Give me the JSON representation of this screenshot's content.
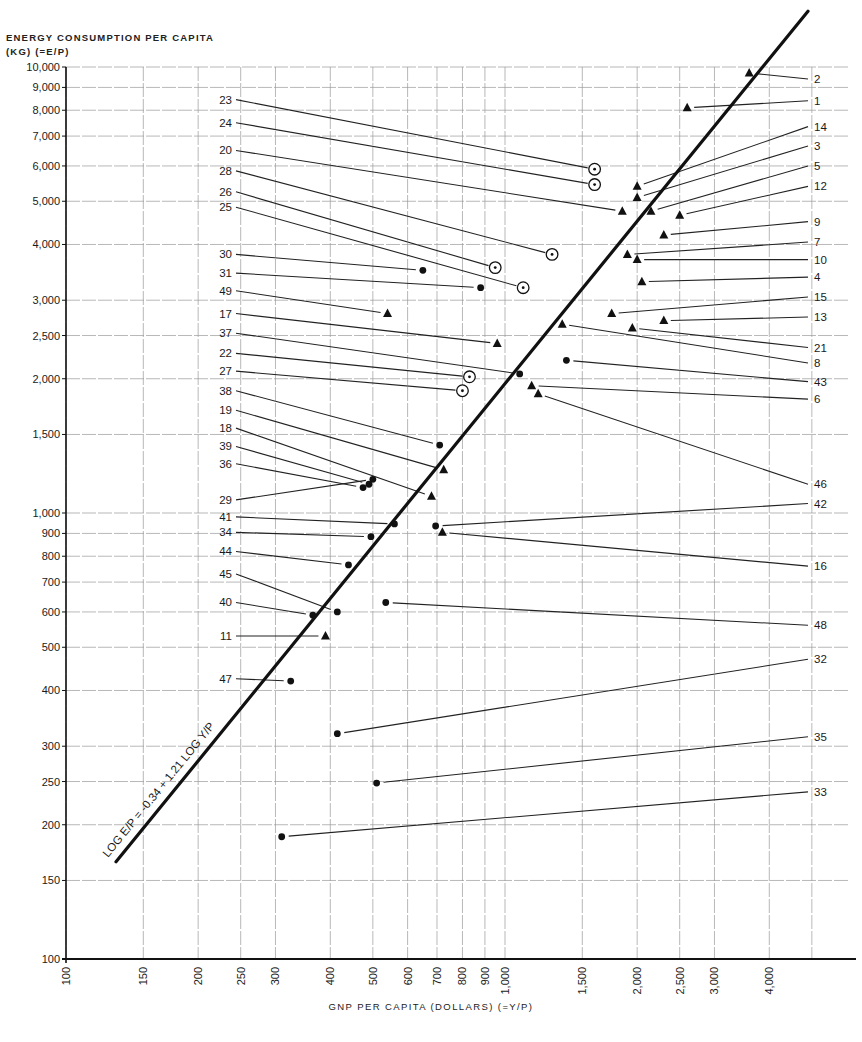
{
  "chart_data": {
    "type": "scatter",
    "title": "",
    "ylabel_line1": "ENERGY CONSUMPTION PER CAPITA",
    "ylabel_line2": "(KG) (=E/P)",
    "xlabel": "GNP PER CAPITA (DOLLARS) (=Y/P)",
    "x_scale": "log",
    "y_scale": "log",
    "xlim": [
      100,
      5200
    ],
    "ylim": [
      100,
      10000
    ],
    "grid": true,
    "x_ticks": [
      "100",
      "150",
      "200",
      "250",
      "300",
      "400",
      "500",
      "600",
      "700",
      "800",
      "900",
      "1,000",
      "1,500",
      "2,000",
      "2,500",
      "3,000",
      "4,000"
    ],
    "x_tick_values": [
      100,
      150,
      200,
      250,
      300,
      400,
      500,
      600,
      700,
      800,
      900,
      1000,
      1500,
      2000,
      2500,
      3000,
      4000
    ],
    "y_ticks": [
      "100",
      "150",
      "200",
      "250",
      "300",
      "400",
      "500",
      "600",
      "700",
      "800",
      "900",
      "1,000",
      "1,500",
      "2,000",
      "2,500",
      "3,000",
      "4,000",
      "5,000",
      "6,000",
      "7,000",
      "8,000",
      "9,000",
      "10,000"
    ],
    "y_tick_values": [
      100,
      150,
      200,
      250,
      300,
      400,
      500,
      600,
      700,
      800,
      900,
      1000,
      1500,
      2000,
      2500,
      3000,
      4000,
      5000,
      6000,
      7000,
      8000,
      9000,
      10000
    ],
    "regression": {
      "label": "LOG E/P = -0.34 + 1.21 LOG Y/P",
      "intercept": -0.34,
      "slope": 1.21,
      "x_range": [
        130,
        4900
      ]
    },
    "marker_legend": {
      "triangle": "filled triangle",
      "dot": "filled circle",
      "circled_dot": "circle with center dot"
    },
    "points": [
      {
        "id": "1",
        "marker": "triangle",
        "x": 2600,
        "y": 8100,
        "label_side": "right"
      },
      {
        "id": "2",
        "marker": "triangle",
        "x": 3600,
        "y": 9700,
        "label_side": "right"
      },
      {
        "id": "3",
        "marker": "triangle",
        "x": 2000,
        "y": 5100,
        "label_side": "right"
      },
      {
        "id": "4",
        "marker": "triangle",
        "x": 2050,
        "y": 3300,
        "label_side": "right"
      },
      {
        "id": "5",
        "marker": "triangle",
        "x": 2150,
        "y": 4750,
        "label_side": "right"
      },
      {
        "id": "6",
        "marker": "triangle",
        "x": 1150,
        "y": 1930,
        "label_side": "right"
      },
      {
        "id": "7",
        "marker": "triangle",
        "x": 1900,
        "y": 3800,
        "label_side": "right"
      },
      {
        "id": "8",
        "marker": "triangle",
        "x": 1350,
        "y": 2650,
        "label_side": "right"
      },
      {
        "id": "9",
        "marker": "triangle",
        "x": 2300,
        "y": 4200,
        "label_side": "right"
      },
      {
        "id": "10",
        "marker": "triangle",
        "x": 2000,
        "y": 3700,
        "label_side": "right"
      },
      {
        "id": "11",
        "marker": "triangle",
        "x": 390,
        "y": 530,
        "label_side": "left"
      },
      {
        "id": "12",
        "marker": "triangle",
        "x": 2500,
        "y": 4650,
        "label_side": "right"
      },
      {
        "id": "13",
        "marker": "triangle",
        "x": 2300,
        "y": 2700,
        "label_side": "right"
      },
      {
        "id": "14",
        "marker": "triangle",
        "x": 2000,
        "y": 5400,
        "label_side": "right"
      },
      {
        "id": "15",
        "marker": "triangle",
        "x": 1750,
        "y": 2800,
        "label_side": "right"
      },
      {
        "id": "16",
        "marker": "triangle",
        "x": 720,
        "y": 905,
        "label_side": "right"
      },
      {
        "id": "17",
        "marker": "triangle",
        "x": 960,
        "y": 2400,
        "label_side": "left"
      },
      {
        "id": "18",
        "marker": "triangle",
        "x": 680,
        "y": 1090,
        "label_side": "left"
      },
      {
        "id": "19",
        "marker": "triangle",
        "x": 725,
        "y": 1250,
        "label_side": "left"
      },
      {
        "id": "20",
        "marker": "triangle",
        "x": 1850,
        "y": 4750,
        "label_side": "left"
      },
      {
        "id": "21",
        "marker": "triangle",
        "x": 1950,
        "y": 2600,
        "label_side": "right"
      },
      {
        "id": "22",
        "marker": "circled_dot",
        "x": 830,
        "y": 2020,
        "label_side": "left"
      },
      {
        "id": "23",
        "marker": "circled_dot",
        "x": 1600,
        "y": 5900,
        "label_side": "left"
      },
      {
        "id": "24",
        "marker": "circled_dot",
        "x": 1600,
        "y": 5450,
        "label_side": "left"
      },
      {
        "id": "25",
        "marker": "circled_dot",
        "x": 1100,
        "y": 3200,
        "label_side": "left"
      },
      {
        "id": "26",
        "marker": "circled_dot",
        "x": 950,
        "y": 3550,
        "label_side": "left"
      },
      {
        "id": "27",
        "marker": "circled_dot",
        "x": 800,
        "y": 1880,
        "label_side": "left"
      },
      {
        "id": "28",
        "marker": "circled_dot",
        "x": 1280,
        "y": 3800,
        "label_side": "left"
      },
      {
        "id": "29",
        "marker": "dot",
        "x": 500,
        "y": 1190,
        "label_side": "left"
      },
      {
        "id": "30",
        "marker": "dot",
        "x": 650,
        "y": 3500,
        "label_side": "left"
      },
      {
        "id": "31",
        "marker": "dot",
        "x": 880,
        "y": 3200,
        "label_side": "left"
      },
      {
        "id": "32",
        "marker": "dot",
        "x": 415,
        "y": 320,
        "label_side": "right"
      },
      {
        "id": "33",
        "marker": "dot",
        "x": 310,
        "y": 188,
        "label_side": "right"
      },
      {
        "id": "34",
        "marker": "dot",
        "x": 495,
        "y": 885,
        "label_side": "left"
      },
      {
        "id": "35",
        "marker": "dot",
        "x": 510,
        "y": 248,
        "label_side": "right"
      },
      {
        "id": "36",
        "marker": "dot",
        "x": 475,
        "y": 1140,
        "label_side": "left"
      },
      {
        "id": "37",
        "marker": "dot",
        "x": 1080,
        "y": 2050,
        "label_side": "left"
      },
      {
        "id": "38",
        "marker": "dot",
        "x": 710,
        "y": 1420,
        "label_side": "left"
      },
      {
        "id": "39",
        "marker": "dot",
        "x": 490,
        "y": 1160,
        "label_side": "left"
      },
      {
        "id": "40",
        "marker": "dot",
        "x": 365,
        "y": 590,
        "label_side": "left"
      },
      {
        "id": "41",
        "marker": "dot",
        "x": 560,
        "y": 945,
        "label_side": "left"
      },
      {
        "id": "42",
        "marker": "dot",
        "x": 695,
        "y": 935,
        "label_side": "right"
      },
      {
        "id": "43",
        "marker": "dot",
        "x": 1380,
        "y": 2200,
        "label_side": "right"
      },
      {
        "id": "44",
        "marker": "dot",
        "x": 440,
        "y": 765,
        "label_side": "left"
      },
      {
        "id": "45",
        "marker": "dot",
        "x": 415,
        "y": 600,
        "label_side": "left"
      },
      {
        "id": "46",
        "marker": "triangle",
        "x": 1190,
        "y": 1850,
        "label_side": "right"
      },
      {
        "id": "47",
        "marker": "dot",
        "x": 325,
        "y": 420,
        "label_side": "left"
      },
      {
        "id": "48",
        "marker": "dot",
        "x": 535,
        "y": 630,
        "label_side": "right"
      },
      {
        "id": "49",
        "marker": "triangle",
        "x": 540,
        "y": 2800,
        "label_side": "left"
      }
    ],
    "left_label_y": {
      "23": 8450,
      "24": 7500,
      "20": 6500,
      "28": 5850,
      "26": 5250,
      "25": 4850,
      "30": 3800,
      "31": 3450,
      "49": 3150,
      "17": 2800,
      "37": 2530,
      "22": 2280,
      "27": 2080,
      "38": 1880,
      "19": 1700,
      "18": 1550,
      "39": 1410,
      "36": 1290,
      "29": 1070,
      "41": 980,
      "34": 905,
      "44": 820,
      "45": 730,
      "40": 630,
      "11": 530,
      "47": 425
    },
    "right_label_y": {
      "2": 9400,
      "1": 8400,
      "14": 7350,
      "3": 6650,
      "5": 6000,
      "12": 5400,
      "9": 4500,
      "7": 4050,
      "10": 3700,
      "4": 3380,
      "15": 3050,
      "13": 2750,
      "21": 2350,
      "8": 2170,
      "43": 1970,
      "6": 1800,
      "46": 1160,
      "42": 1050,
      "16": 760,
      "48": 560,
      "32": 470,
      "35": 315,
      "33": 237
    }
  }
}
